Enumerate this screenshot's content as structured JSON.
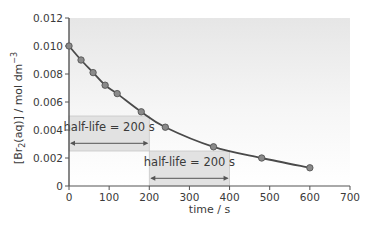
{
  "chart_data": {
    "type": "line",
    "title": "",
    "xlabel": "time / s",
    "ylabel": "[Br2(aq)] / mol dm-3",
    "ylabel_parts": {
      "pre": "[Br",
      "sub": "2",
      "mid": "(aq)] / mol dm",
      "sup": "−3"
    },
    "xlim": [
      0,
      700
    ],
    "ylim": [
      0,
      0.012
    ],
    "x_ticks": [
      0,
      100,
      200,
      300,
      400,
      500,
      600,
      700
    ],
    "x_tick_labels": [
      "0",
      "100",
      "200",
      "300",
      "400",
      "500",
      "600",
      "700"
    ],
    "y_ticks": [
      0,
      0.002,
      0.004,
      0.006,
      0.008,
      0.01,
      0.012
    ],
    "y_tick_labels": [
      "0",
      "0.002",
      "0.004",
      "0.006",
      "0.008",
      "0.010",
      "0.012"
    ],
    "grid": false,
    "legend": null,
    "series": [
      {
        "name": "[Br2(aq)]",
        "x": [
          0,
          30,
          60,
          90,
          120,
          180,
          240,
          360,
          480,
          600
        ],
        "y": [
          0.01,
          0.009,
          0.0081,
          0.0072,
          0.0066,
          0.0053,
          0.0042,
          0.0028,
          0.002,
          0.0013
        ],
        "marker": "circle",
        "smooth": true
      }
    ],
    "annotations": [
      {
        "type": "bracket-box",
        "label": "half-life = 200 s",
        "x_from": 0,
        "x_to": 200,
        "y_top": 0.005,
        "y_bottom": 0.0025
      },
      {
        "type": "bracket-box",
        "label": "half-life = 200 s",
        "x_from": 200,
        "x_to": 400,
        "y_top": 0.0025,
        "y_bottom": 0
      }
    ],
    "colors": {
      "line": "#4a4a4a",
      "marker_fill": "#8a8a8a",
      "marker_stroke": "#555555",
      "axis": "#555555",
      "plot_bg_top": "#e6e6e6",
      "plot_bg_bottom": "#ffffff",
      "annotation_box": "#e2e2e2"
    }
  }
}
